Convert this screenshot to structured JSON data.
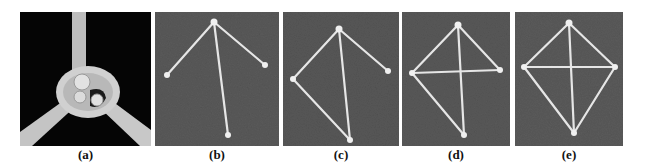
{
  "figure": {
    "panels": [
      {
        "id": "a",
        "label": "(a)",
        "description": "Close-up of knotted joint connecting three sticks",
        "background": "#050505"
      },
      {
        "id": "b",
        "label": "(b)",
        "description": "Three sticks radiating from apex joint",
        "background": "#5a5a5a"
      },
      {
        "id": "c",
        "label": "(c)",
        "description": "Left stick connected to bottom stick end",
        "background": "#585858"
      },
      {
        "id": "d",
        "label": "(d)",
        "description": "Horizontal crossbar added between left and right ends",
        "background": "#595959"
      },
      {
        "id": "e",
        "label": "(e)",
        "description": "Completed kite-shaped frame",
        "background": "#5b5b5b"
      }
    ],
    "stick_color": "#e6e6e6"
  }
}
